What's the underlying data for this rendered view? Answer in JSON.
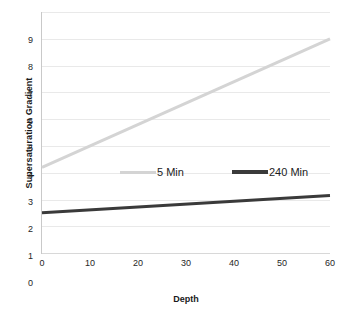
{
  "chart_data": {
    "type": "line",
    "title": "",
    "xlabel": "Depth",
    "ylabel": "Supersaturation Gradient",
    "xlim": [
      0,
      60
    ],
    "ylim": [
      0,
      9
    ],
    "xticks": [
      0,
      10,
      20,
      30,
      40,
      50,
      60
    ],
    "yticks": [
      0,
      1,
      2,
      3,
      4,
      5,
      6,
      7,
      8,
      9
    ],
    "xtick_labels": [
      "0",
      "10",
      "20",
      "30",
      "40",
      "50",
      "60"
    ],
    "ytick_labels": [
      "0",
      "1",
      "2",
      "3",
      "4",
      "5",
      "6",
      "7",
      "8",
      "9"
    ],
    "ytick_clipped_top_label": "10",
    "grid": "horizontal",
    "legend_position": "inside-center",
    "x": [
      0,
      60
    ],
    "series": [
      {
        "name": "5 Min",
        "color": "#d4d4d4",
        "linewidth": 3,
        "values": [
          3.2,
          8.0
        ]
      },
      {
        "name": "240 Min",
        "color": "#3a3a3a",
        "linewidth": 3,
        "values": [
          1.5,
          2.15
        ]
      }
    ],
    "legend": [
      {
        "label": "5 Min",
        "color": "#d4d4d4"
      },
      {
        "label": "240 Min",
        "color": "#3a3a3a"
      }
    ]
  },
  "axes": {
    "y_title": "Supersaturation Gradient",
    "x_title": "Depth"
  },
  "colors": {
    "gridline": "#e9e9e9",
    "axis": "#c9c9c9",
    "text": "#262626",
    "series_light": "#d4d4d4",
    "series_dark": "#3a3a3a",
    "background": "#ffffff"
  }
}
